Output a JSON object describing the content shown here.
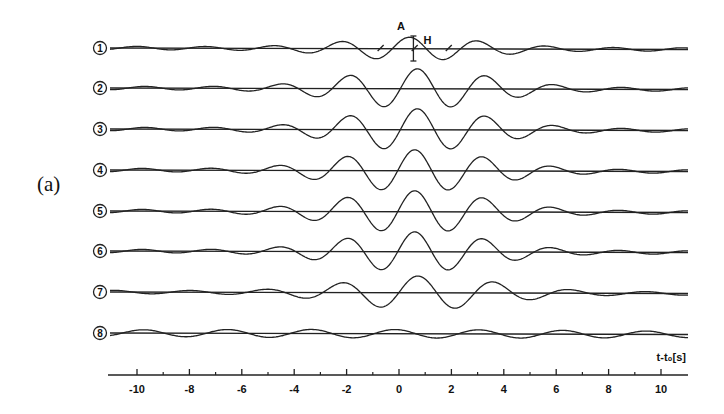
{
  "panel_label": "(a)",
  "chart_data": {
    "type": "line",
    "title": "",
    "xlabel": "t-t₀[s]",
    "ylabel": "",
    "xlim": [
      -11,
      11
    ],
    "x_ticks_major": [
      -10,
      -8,
      -6,
      -4,
      -2,
      0,
      2,
      4,
      6,
      8,
      10
    ],
    "x_tick_labels": [
      "-10",
      "-8",
      "-6",
      "-4",
      "-2",
      "0",
      "2",
      "4",
      "6",
      "8",
      "10"
    ],
    "x_ticks_minor": [
      -9,
      -7,
      -5,
      -3,
      -1,
      1,
      3,
      5,
      7,
      9
    ],
    "grid": false,
    "legend": "none",
    "series": [
      {
        "name": "1",
        "label": "①",
        "center": 0.6,
        "amplitude": 0.55,
        "width": 3.6,
        "period": 2.6,
        "phase": 0.5
      },
      {
        "name": "2",
        "label": "②",
        "center": 0.7,
        "amplitude": 0.95,
        "width": 3.8,
        "period": 2.6,
        "phase": 0.0
      },
      {
        "name": "3",
        "label": "③",
        "center": 0.7,
        "amplitude": 1.0,
        "width": 3.8,
        "period": 2.6,
        "phase": 0.0
      },
      {
        "name": "4",
        "label": "④",
        "center": 0.6,
        "amplitude": 1.0,
        "width": 3.9,
        "period": 2.6,
        "phase": 0.0
      },
      {
        "name": "5",
        "label": "⑤",
        "center": 0.6,
        "amplitude": 1.0,
        "width": 3.9,
        "period": 2.6,
        "phase": 0.0
      },
      {
        "name": "6",
        "label": "⑥",
        "center": 0.6,
        "amplitude": 0.95,
        "width": 3.8,
        "period": 2.6,
        "phase": 0.0
      },
      {
        "name": "7",
        "label": "⑦",
        "center": 0.9,
        "amplitude": 0.8,
        "width": 3.9,
        "period": 2.9,
        "phase": 0.4
      },
      {
        "name": "8",
        "label": "⑧",
        "center": 0.0,
        "amplitude": 0.2,
        "width": 20.0,
        "period": 3.2,
        "phase": 0.3
      }
    ],
    "annotations": [
      {
        "text": "A",
        "x": 0.0,
        "trace": "1",
        "note": "amplitude label above central lobe"
      },
      {
        "text": "H",
        "x": 0.9,
        "trace": "1",
        "note": "vertical height marker bar"
      },
      {
        "text": "tick marks at zero crossings",
        "x": [
          -0.7,
          0.6,
          1.9
        ],
        "trace": "1"
      }
    ]
  }
}
